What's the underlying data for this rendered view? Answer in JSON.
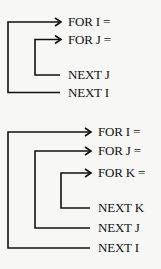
{
  "diagrams": [
    {
      "name": "two-level-nested-loop",
      "labels": [
        "FOR I =",
        "FOR J =",
        "NEXT J",
        "NEXT I"
      ]
    },
    {
      "name": "three-level-nested-loop",
      "labels": [
        "FOR I =",
        "FOR J =",
        "FOR K =",
        "NEXT K",
        "NEXT J",
        "NEXT I"
      ]
    }
  ]
}
